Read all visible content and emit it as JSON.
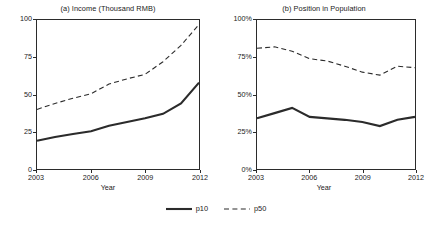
{
  "figure": {
    "width": 432,
    "height": 229,
    "background": "#ffffff",
    "line_color": "#2b2b2b"
  },
  "legend": {
    "position": "bottom-center",
    "entries": [
      {
        "label": "p10",
        "style": "solid",
        "key_icon": "solid-line-icon"
      },
      {
        "label": "p50",
        "style": "dashed",
        "key_icon": "dashed-line-icon"
      }
    ]
  },
  "chart_data": [
    {
      "type": "line",
      "panel": "a",
      "title": "(a) Income (Thousand RMB)",
      "xlabel": "Year",
      "ylabel": "",
      "xlim": [
        2003,
        2012
      ],
      "ylim": [
        0,
        100
      ],
      "xticks": [
        2003,
        2006,
        2009,
        2012
      ],
      "xticklabels": [
        "2003",
        "2006",
        "2009",
        "2012"
      ],
      "yticks": [
        0,
        25,
        50,
        75,
        100
      ],
      "yticklabels": [
        "0",
        "25",
        "50",
        "75",
        "100"
      ],
      "grid": false,
      "legend_position": "below-figure",
      "x": [
        2003,
        2004,
        2005,
        2006,
        2007,
        2008,
        2009,
        2010,
        2011,
        2012
      ],
      "series": [
        {
          "name": "p10",
          "style": "solid",
          "values": [
            19.0,
            21.5,
            23.5,
            25.3,
            29.0,
            31.5,
            34.0,
            37.0,
            44.0,
            58.0
          ]
        },
        {
          "name": "p50",
          "style": "dashed",
          "values": [
            40.0,
            44.0,
            47.5,
            50.5,
            57.0,
            60.5,
            63.5,
            72.0,
            83.0,
            97.0
          ]
        }
      ]
    },
    {
      "type": "line",
      "panel": "b",
      "title": "(b) Position in Population",
      "xlabel": "Year",
      "ylabel": "",
      "xlim": [
        2003,
        2012
      ],
      "ylim": [
        0,
        100
      ],
      "xticks": [
        2003,
        2006,
        2009,
        2012
      ],
      "xticklabels": [
        "2003",
        "2006",
        "2009",
        "2012"
      ],
      "yticks": [
        0,
        25,
        50,
        75,
        100
      ],
      "yticklabels": [
        "0%",
        "25%",
        "50%",
        "75%",
        "100%"
      ],
      "grid": false,
      "legend_position": "below-figure",
      "x": [
        2003,
        2004,
        2005,
        2006,
        2007,
        2008,
        2009,
        2010,
        2011,
        2012
      ],
      "series": [
        {
          "name": "p10",
          "style": "solid",
          "values": [
            34.0,
            37.5,
            41.0,
            35.0,
            34.0,
            33.0,
            31.5,
            28.8,
            33.0,
            35.0
          ]
        },
        {
          "name": "p50",
          "style": "dashed",
          "values": [
            81.0,
            82.0,
            79.0,
            74.0,
            72.5,
            69.0,
            65.0,
            63.0,
            69.0,
            68.0
          ]
        }
      ]
    }
  ]
}
